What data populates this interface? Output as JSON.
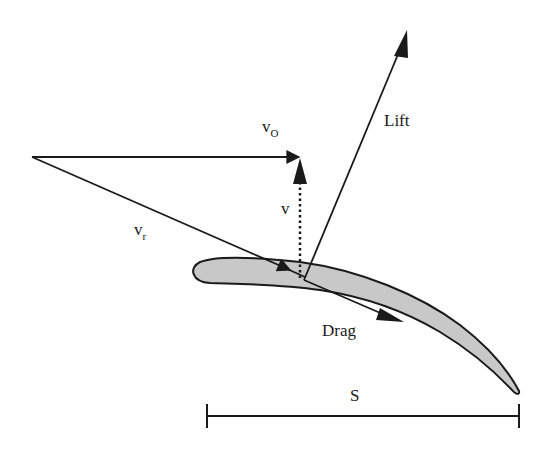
{
  "diagram": {
    "type": "blade-velocity-force-diagram",
    "colors": {
      "line": "#1a1a1a",
      "blade_fill": "#c8c8c8",
      "blade_outline": "#1a1a1a",
      "background": "#ffffff"
    },
    "vectors": {
      "v_o": {
        "symbol": "v",
        "subscript": "O"
      },
      "v_r": {
        "symbol": "v",
        "subscript": "r"
      },
      "v": {
        "symbol": "v",
        "style": "dotted"
      },
      "lift": {
        "label": "Lift"
      },
      "drag": {
        "label": "Drag"
      }
    },
    "span": {
      "label": "S"
    }
  }
}
